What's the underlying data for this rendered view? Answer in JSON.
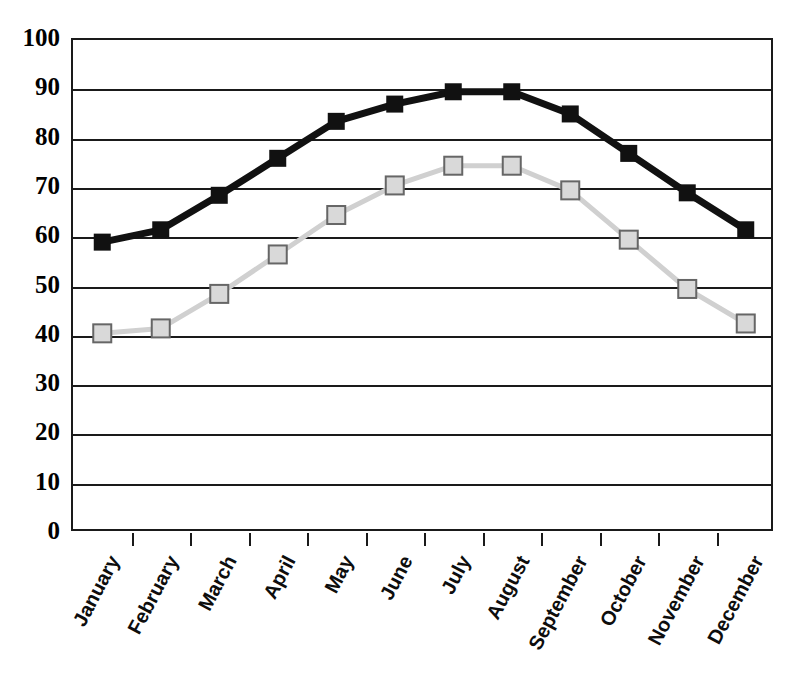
{
  "chart_data": {
    "type": "line",
    "title": "",
    "xlabel": "",
    "ylabel": "",
    "ylim": [
      0,
      100
    ],
    "ytick_step": 10,
    "yticks": [
      100,
      90,
      80,
      70,
      60,
      50,
      40,
      30,
      20,
      10,
      0
    ],
    "grid": true,
    "legend": "none",
    "categories": [
      "January",
      "February",
      "March",
      "April",
      "May",
      "June",
      "July",
      "August",
      "September",
      "October",
      "November",
      "December"
    ],
    "series": [
      {
        "name": "series-dark",
        "marker": "filled-square",
        "color": "#111111",
        "line_color": "#111111",
        "values": [
          59,
          61.5,
          68.5,
          76,
          83.5,
          87,
          89.5,
          89.5,
          85,
          77,
          69,
          61.5
        ]
      },
      {
        "name": "series-light",
        "marker": "open-square",
        "color": "#d9d9d9",
        "line_color": "#d0d0d0",
        "marker_border": "#666666",
        "values": [
          40.5,
          41.5,
          48.5,
          56.5,
          64.5,
          70.5,
          74.5,
          74.5,
          69.5,
          59.5,
          49.5,
          42.5
        ]
      }
    ]
  },
  "axis": {
    "frame_color": "#1a1a1a",
    "gridline_color": "#1a1a1a"
  }
}
